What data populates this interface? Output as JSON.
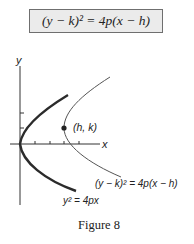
{
  "header": {
    "formula": "(y − k)² = 4p(x − h)"
  },
  "diagram": {
    "axes": {
      "x_label": "x",
      "y_label": "y"
    },
    "vertex_point": {
      "label": "(h, k)"
    },
    "curves": [
      {
        "name": "standard-parabola",
        "equation_label": "y² = 4px",
        "style": "thick"
      },
      {
        "name": "shifted-parabola",
        "equation_label": "(y − k)² = 4p(x − h)",
        "style": "thin"
      }
    ],
    "colors": {
      "stroke": "#2b2b2b",
      "thin_stroke": "#555555",
      "box_fill": "#ebebeb",
      "box_border": "#6f6f6f"
    }
  },
  "caption": "Figure 8"
}
